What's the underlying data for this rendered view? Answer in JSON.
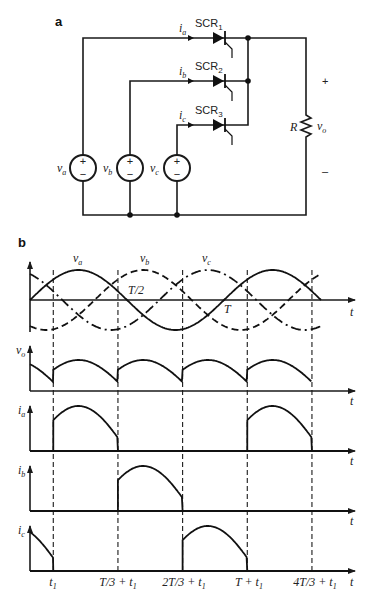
{
  "panel_a": {
    "label": "a",
    "scrs": [
      {
        "name": "SCR",
        "index": "1",
        "current": "i",
        "current_sub": "a"
      },
      {
        "name": "SCR",
        "index": "2",
        "current": "i",
        "current_sub": "b"
      },
      {
        "name": "SCR",
        "index": "3",
        "current": "i",
        "current_sub": "c"
      }
    ],
    "sources": [
      {
        "name": "v",
        "sub": "a",
        "plus": "+",
        "minus": "−"
      },
      {
        "name": "v",
        "sub": "b",
        "plus": "+",
        "minus": "−"
      },
      {
        "name": "v",
        "sub": "c",
        "plus": "+",
        "minus": "−"
      }
    ],
    "load": {
      "resistor": "R",
      "voltage": "v",
      "voltage_sub": "o",
      "plus": "+",
      "minus": "–"
    }
  },
  "panel_b": {
    "label": "b",
    "input_labels": [
      {
        "name": "v",
        "sub": "a"
      },
      {
        "name": "v",
        "sub": "b"
      },
      {
        "name": "v",
        "sub": "c"
      }
    ],
    "half_period_label": "T/2",
    "period_label": "T",
    "time_axis_label": "t",
    "plots": [
      {
        "ylabel": "v",
        "sub": "o"
      },
      {
        "ylabel": "i",
        "sub": "a"
      },
      {
        "ylabel": "i",
        "sub": "b"
      },
      {
        "ylabel": "i",
        "sub": "c"
      }
    ],
    "tick_labels": [
      {
        "main": "t",
        "sub": "1",
        "pre": ""
      },
      {
        "main": "T/3 + t",
        "sub": "1",
        "pre": ""
      },
      {
        "main": "2T/3 + t",
        "sub": "1",
        "pre": ""
      },
      {
        "main": "T + t",
        "sub": "1",
        "pre": ""
      },
      {
        "main": "4T/3 + t",
        "sub": "1",
        "pre": ""
      }
    ]
  },
  "chart_data": {
    "type": "line",
    "xlabel": "t",
    "period_fraction_of_t1": 0.12,
    "x_range_periods": [
      0,
      1.5
    ],
    "series": [
      {
        "name": "va",
        "phase_deg": 0,
        "style": "solid"
      },
      {
        "name": "vb",
        "phase_deg": -120,
        "style": "dashed"
      },
      {
        "name": "vc",
        "phase_deg": -240,
        "style": "dash-dot"
      }
    ],
    "firing_instants": [
      "t1",
      "T/3 + t1",
      "2T/3 + t1",
      "T + t1",
      "4T/3 + t1"
    ],
    "conduction": {
      "ia": [
        [
          "t1",
          "T/3 + t1"
        ],
        [
          "T + t1",
          "4T/3 + t1"
        ]
      ],
      "ib": [
        [
          "T/3 + t1",
          "2T/3 + t1"
        ]
      ],
      "ic": [
        [
          "0",
          "t1"
        ],
        [
          "2T/3 + t1",
          "T + t1"
        ]
      ]
    }
  }
}
